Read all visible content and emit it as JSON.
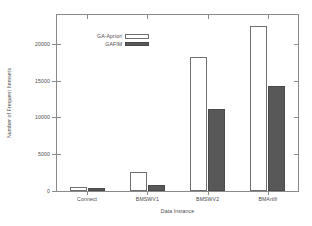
{
  "chart_data": {
    "type": "bar",
    "title": "",
    "xlabel": "Data Instance",
    "ylabel": "Number of Frequent Itemsets",
    "categories": [
      "Connect",
      "BMSWV1",
      "BMSWV2",
      "BMArtifi"
    ],
    "series": [
      {
        "name": "GA-Apriori",
        "values": [
          600,
          2550,
          18200,
          22400
        ],
        "color": "#ffffff"
      },
      {
        "name": "GAFIM",
        "values": [
          350,
          850,
          11100,
          14200
        ],
        "color": "#585858"
      }
    ],
    "ylim": [
      0,
      23900
    ],
    "yticks": [
      0,
      5000,
      10000,
      15000,
      20000
    ],
    "ytick_labels": [
      "0",
      "5000",
      "10000",
      "15000",
      "20000"
    ],
    "grid": false,
    "legend_position": "upper left"
  },
  "legend": {
    "entries": [
      {
        "label": "GA-Apriori"
      },
      {
        "label": "GAFIM"
      }
    ]
  }
}
